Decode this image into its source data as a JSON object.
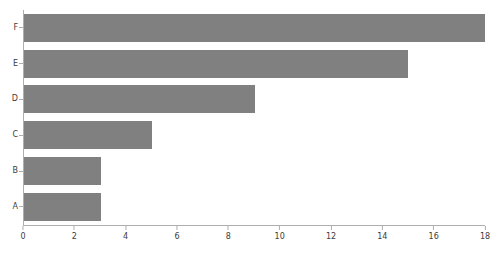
{
  "chart_data": {
    "type": "bar",
    "orientation": "horizontal",
    "title": "",
    "subtitle": "",
    "xlabel": "",
    "ylabel": "",
    "categories": [
      "A",
      "B",
      "C",
      "D",
      "E",
      "F"
    ],
    "values": [
      3,
      3,
      5,
      9,
      15,
      18
    ],
    "series": [
      {
        "name": "",
        "values": [
          3,
          3,
          5,
          9,
          15,
          18
        ]
      }
    ],
    "xlim": [
      0,
      18
    ],
    "xticks": [
      0,
      2,
      4,
      6,
      8,
      10,
      12,
      14,
      16,
      18
    ],
    "xtick_labels": [
      "0",
      "2",
      "4",
      "6",
      "8",
      "10",
      "12",
      "14",
      "16",
      "18"
    ],
    "ytick_labels": [
      "F",
      "E",
      "D",
      "C",
      "B",
      "A"
    ],
    "grid": false,
    "legend": false,
    "legend_position": "none",
    "annotations": [],
    "bar_color": "#808080",
    "axis_color": "#aeaeae",
    "tick_label_color": "#3c3c3c",
    "background_color": "#ffffff",
    "bars_top_to_bottom": [
      {
        "category": "F",
        "value": 18
      },
      {
        "category": "E",
        "value": 15
      },
      {
        "category": "D",
        "value": 9
      },
      {
        "category": "C",
        "value": 5
      },
      {
        "category": "B",
        "value": 3
      },
      {
        "category": "A",
        "value": 3
      }
    ]
  }
}
